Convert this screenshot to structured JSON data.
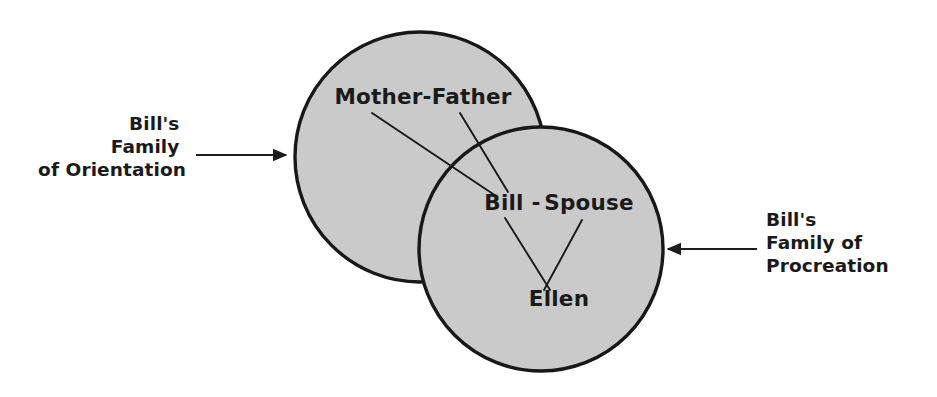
{
  "diagram": {
    "type": "venn",
    "background_color": "#ffffff",
    "circle_fill_color": "#cacaca",
    "circle_stroke_color": "#181818",
    "text_color": "#1a1a1a",
    "sets": [
      {
        "id": "family-of-orientation",
        "label_lines": [
          "Bill's",
          "Family",
          "of Orientation"
        ],
        "label_full": "Bill's Family of Orientation",
        "cx": 420,
        "cy": 157,
        "r": 125,
        "side": "left"
      },
      {
        "id": "family-of-procreation",
        "label_lines": [
          "Bill's",
          "Family of",
          "Procreation"
        ],
        "label_full": "Bill's Family of Procreation",
        "cx": 541,
        "cy": 249,
        "r": 122,
        "side": "right"
      }
    ],
    "members": [
      {
        "id": "mother-father",
        "text": "Mother-Father",
        "x": 423,
        "y": 104,
        "anchor": "middle",
        "region": "left-only"
      },
      {
        "id": "bill",
        "text": "Bill",
        "x": 504,
        "y": 210,
        "anchor": "middle",
        "region": "intersection"
      },
      {
        "id": "dash",
        "text": "-",
        "x": 536,
        "y": 210,
        "anchor": "middle",
        "region": "intersection"
      },
      {
        "id": "spouse",
        "text": "Spouse",
        "x": 589,
        "y": 210,
        "anchor": "middle",
        "region": "right-only"
      },
      {
        "id": "ellen",
        "text": "Ellen",
        "x": 559,
        "y": 306,
        "anchor": "middle",
        "region": "right-only"
      }
    ],
    "leader_lines": [
      {
        "id": "mother-to-bill",
        "from": "mother-father",
        "to": "bill",
        "x1": 372,
        "y1": 113,
        "x2": 496,
        "y2": 196
      },
      {
        "id": "father-to-bill",
        "from": "mother-father",
        "to": "bill",
        "x1": 460,
        "y1": 113,
        "x2": 508,
        "y2": 192
      },
      {
        "id": "bill-to-ellen",
        "from": "bill",
        "to": "ellen",
        "x1": 505,
        "y1": 218,
        "x2": 550,
        "y2": 290
      },
      {
        "id": "spouse-to-ellen",
        "from": "spouse",
        "to": "ellen",
        "x1": 582,
        "y1": 220,
        "x2": 544,
        "y2": 290
      }
    ],
    "pointers": [
      {
        "id": "left-pointer",
        "from_x": 196,
        "from_y": 155,
        "to_x": 288,
        "to_y": 155,
        "direction": "right"
      },
      {
        "id": "right-pointer",
        "from_x": 757,
        "from_y": 249,
        "to_x": 666,
        "to_y": 249,
        "direction": "left"
      }
    ],
    "side_labels": {
      "left": {
        "x": 186,
        "y": 130,
        "line_height": 23,
        "anchor": "end"
      },
      "right": {
        "x": 766,
        "y": 226,
        "line_height": 23,
        "anchor": "start"
      }
    }
  }
}
